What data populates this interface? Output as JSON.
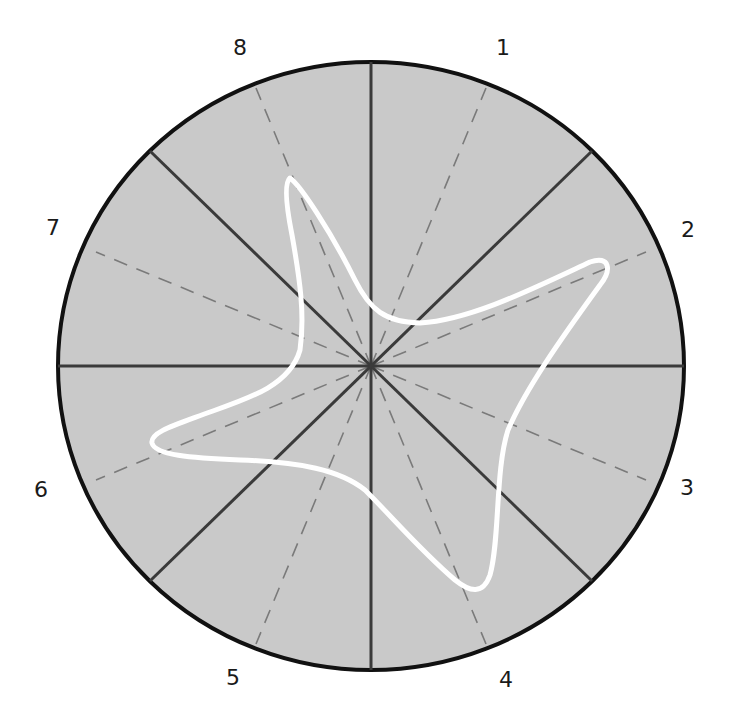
{
  "diagram": {
    "type": "polar-sector-diagram",
    "center": [
      371,
      366
    ],
    "radius_x": 313,
    "radius_y": 304,
    "colors": {
      "background": "#ffffff",
      "disc_fill": "#c9c9c9",
      "outline": "#111111",
      "sector_lines": "#3a3a3a",
      "dashed_lines": "#7a7a7a",
      "curve": "#ffffff"
    },
    "sector_labels": [
      {
        "text": "1",
        "x": 503,
        "y": 48
      },
      {
        "text": "2",
        "x": 688,
        "y": 230
      },
      {
        "text": "3",
        "x": 687,
        "y": 488
      },
      {
        "text": "4",
        "x": 506,
        "y": 680
      },
      {
        "text": "5",
        "x": 233,
        "y": 678
      },
      {
        "text": "6",
        "x": 41,
        "y": 490
      },
      {
        "text": "7",
        "x": 53,
        "y": 228
      },
      {
        "text": "8",
        "x": 240,
        "y": 48
      }
    ],
    "sector_lines_deg": [
      0,
      45,
      90,
      135
    ],
    "dashed_lines_deg": [
      22.5,
      67.5,
      112.5,
      157.5
    ],
    "curve": {
      "description": "four-lobed star-shaped closed curve",
      "lobe_tips": [
        {
          "near_label": "8",
          "x": 290,
          "y": 178
        },
        {
          "near_label": "2",
          "x": 605,
          "y": 265
        },
        {
          "near_label": "4",
          "x": 470,
          "y": 590
        },
        {
          "near_label": "6",
          "x": 152,
          "y": 446
        }
      ]
    }
  }
}
